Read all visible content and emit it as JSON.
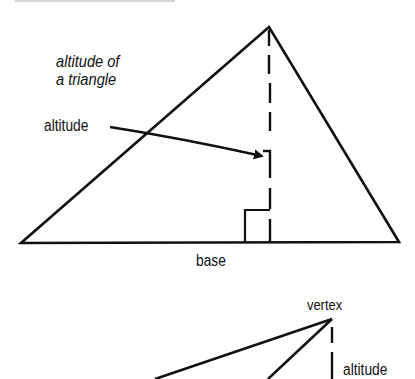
{
  "figure1": {
    "title_line1": "altitude of",
    "title_line2": "a triangle",
    "arrow_label": "altitude",
    "base_label": "base",
    "triangle": {
      "apex": [
        269,
        27
      ],
      "left": [
        21,
        243
      ],
      "right": [
        399,
        242
      ]
    },
    "altitude_x": 270
  },
  "figure2": {
    "vertex_label": "vertex",
    "altitude_label": "altitude",
    "vertex": [
      332,
      319
    ]
  },
  "colors": {
    "ink": "#111111",
    "background": "#ffffff"
  }
}
